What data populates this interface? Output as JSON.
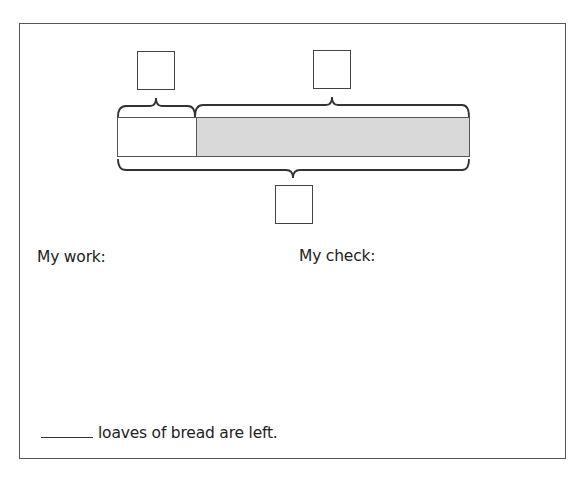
{
  "tape_diagram": {
    "part_label_box": "",
    "remaining_label_box": "",
    "total_label_box": "",
    "shaded_color": "#d9d9d9"
  },
  "sections": {
    "work_label": "My work:",
    "check_label": "My check:"
  },
  "answer": {
    "blank": "",
    "sentence": "loaves of bread are left."
  }
}
